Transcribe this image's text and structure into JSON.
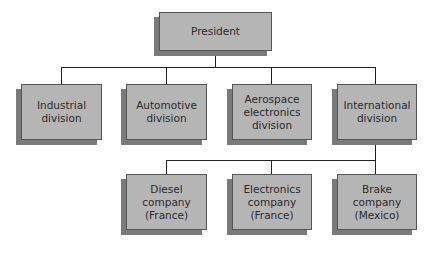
{
  "chart": {
    "type": "organization-chart",
    "root": {
      "id": "president",
      "label": "President"
    },
    "divisions": [
      {
        "id": "industrial",
        "label": "Industrial\ndivision"
      },
      {
        "id": "automotive",
        "label": "Automotive\ndivision"
      },
      {
        "id": "aerospace",
        "label": "Aerospace\nelectronics\ndivision"
      },
      {
        "id": "international",
        "label": "International\ndivision"
      }
    ],
    "companies": [
      {
        "id": "diesel",
        "parent": "international",
        "label": "Diesel\ncompany\n(France)"
      },
      {
        "id": "electronics",
        "parent": "international",
        "label": "Electronics\ncompany\n(France)"
      },
      {
        "id": "brake",
        "parent": "international",
        "label": "Brake\ncompany\n(Mexico)"
      }
    ]
  },
  "colors": {
    "box_fill": "#b5b5b5",
    "box_shadow": "#7a7a7a",
    "connector": "#222222"
  }
}
